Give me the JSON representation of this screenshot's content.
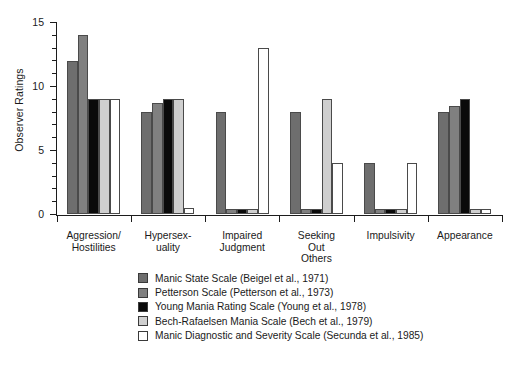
{
  "chart_data": {
    "type": "bar",
    "title": "",
    "xlabel": "",
    "ylabel": "Observer Ratings",
    "ylim": [
      0,
      15
    ],
    "yticks": [
      0,
      5,
      10,
      15
    ],
    "ytick_labels": [
      "0",
      "5",
      "10",
      "15"
    ],
    "minor_ticks": true,
    "grid": false,
    "legend_position": "below",
    "categories": [
      "Aggression/\nHostilities",
      "Hypersex-\nuality",
      "Impaired\nJudgment",
      "Seeking\nOut\nOthers",
      "Impulsivity",
      "Appearance"
    ],
    "series": [
      {
        "name": "Manic State Scale (Beigel et al., 1971)",
        "color": "#6e6e6e",
        "values": [
          12,
          8,
          8,
          8,
          4,
          8
        ]
      },
      {
        "name": "Petterson Scale (Petterson et al., 1973)",
        "color": "#808080",
        "values": [
          14,
          8.7,
          0.4,
          0.4,
          0.4,
          8.5
        ]
      },
      {
        "name": "Young Mania Rating Scale (Young et al., 1978)",
        "color": "#0a0a0a",
        "values": [
          9,
          9,
          0.4,
          0.4,
          0.4,
          9
        ]
      },
      {
        "name": "Bech-Rafaelsen Mania Scale (Bech et al., 1979)",
        "color": "#cfcfcf",
        "values": [
          9,
          9,
          0.4,
          9,
          0.4,
          0.4
        ]
      },
      {
        "name": "Manic Diagnostic and Severity Scale (Secunda et al., 1985)",
        "color": "#ffffff",
        "values": [
          9,
          0.5,
          13,
          4,
          4,
          0.4
        ]
      }
    ]
  },
  "axis": {
    "y_label": "Observer Ratings",
    "y_tick_labels": [
      "0",
      "5",
      "10",
      "15"
    ]
  },
  "legend": {
    "entries": [
      {
        "label": "Manic State Scale (Beigel et al., 1971)",
        "color": "#6e6e6e"
      },
      {
        "label": "Petterson Scale (Petterson et al., 1973)",
        "color": "#808080"
      },
      {
        "label": "Young Mania Rating Scale (Young et al., 1978)",
        "color": "#0a0a0a"
      },
      {
        "label": "Bech-Rafaelsen Mania Scale (Bech et al., 1979)",
        "color": "#cfcfcf"
      },
      {
        "label": "Manic Diagnostic and Severity Scale (Secunda et al., 1985)",
        "color": "#ffffff"
      }
    ]
  },
  "caption": {
    "text": ""
  }
}
